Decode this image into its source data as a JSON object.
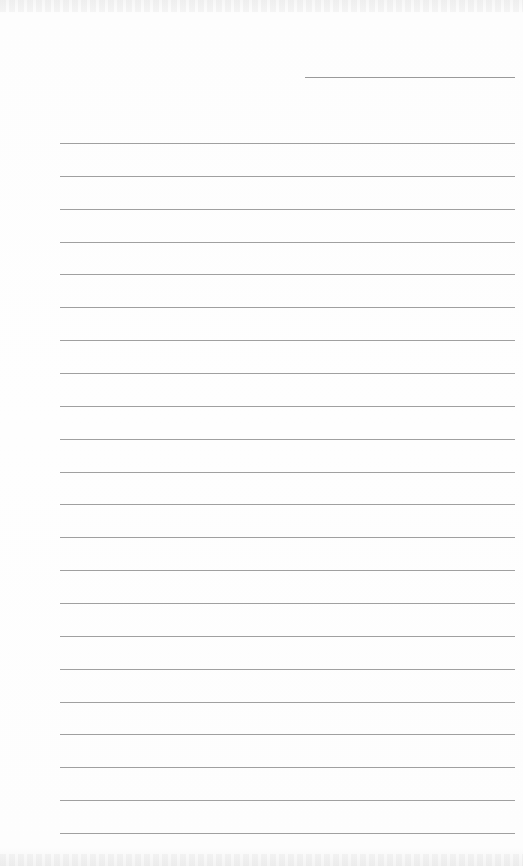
{
  "page": {
    "type": "lined-writing-paper",
    "background_color": "#fdfdfd",
    "line_color": "#a0a0a0",
    "header_line": {
      "label": "",
      "x": 305,
      "y": 77,
      "width": 210
    },
    "ruled_lines": {
      "count": 22,
      "start_y": 143,
      "spacing": 32.86,
      "left": 60,
      "right": 515
    },
    "text": ""
  }
}
